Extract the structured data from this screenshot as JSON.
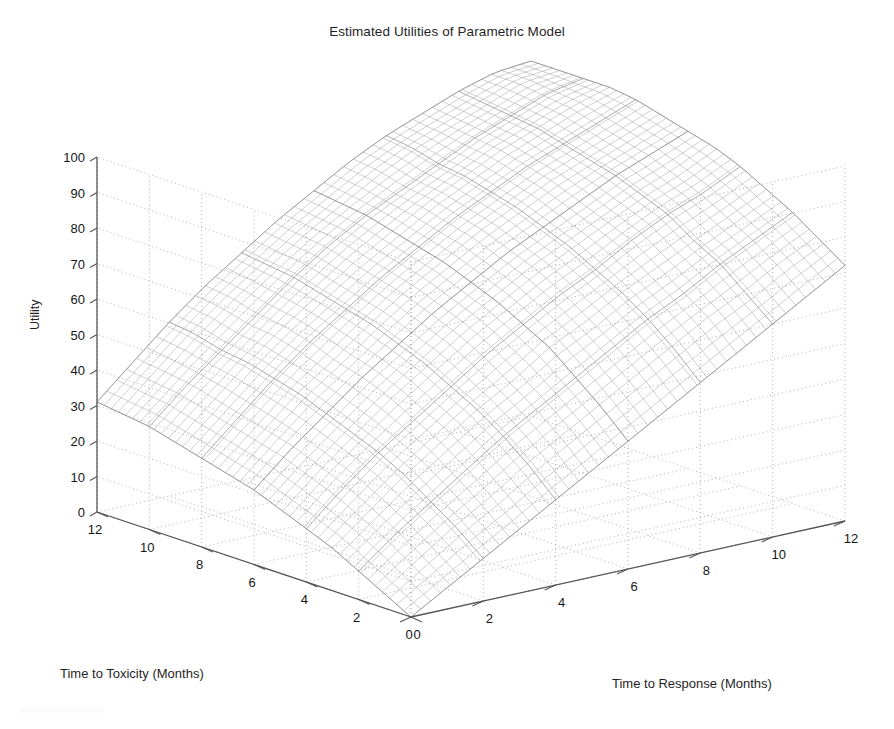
{
  "figure": {
    "title": "Estimated Utilities of Parametric Model",
    "background_color": "#ffffff",
    "axis_color": "#555555",
    "grid_color": "#aaaaaa",
    "mesh_color": "#8a8a8a",
    "width": 894,
    "height": 729
  },
  "axes": {
    "z": {
      "label": "Utility",
      "ticks": [
        "0",
        "10",
        "20",
        "30",
        "40",
        "50",
        "60",
        "70",
        "80",
        "90",
        "100"
      ],
      "min": 0,
      "max": 100
    },
    "x": {
      "label": "Time to Toxicity (Months)",
      "ticks": [
        "0",
        "2",
        "4",
        "6",
        "8",
        "10",
        "12"
      ],
      "min": 0,
      "max": 12
    },
    "y": {
      "label": "Time to Response (Months)",
      "ticks": [
        "0",
        "2",
        "4",
        "6",
        "8",
        "10",
        "12"
      ],
      "min": 0,
      "max": 12
    }
  },
  "chart_data": {
    "type": "surface",
    "title": "Estimated Utilities of Parametric Model",
    "xlabel": "Time to Toxicity (Months)",
    "ylabel": "Time to Response (Months)",
    "zlabel": "Utility",
    "xlim": [
      0,
      12
    ],
    "ylim": [
      0,
      12
    ],
    "zlim": [
      0,
      100
    ],
    "grid": true,
    "legend": "none",
    "x": [
      0,
      1,
      2,
      3,
      4,
      5,
      6,
      7,
      8,
      9,
      10,
      11,
      12
    ],
    "y": [
      0,
      1,
      2,
      3,
      4,
      5,
      6,
      7,
      8,
      9,
      10,
      11,
      12
    ],
    "z_note": "z[yi][xi] = utility at y = Time to Response, x = Time to Toxicity",
    "z": [
      [
        0,
        4,
        8,
        12,
        15,
        18,
        21,
        23,
        25,
        27,
        29,
        30,
        31
      ],
      [
        6,
        11,
        16,
        20,
        24,
        27,
        30,
        32,
        34,
        36,
        38,
        39,
        40
      ],
      [
        12,
        18,
        23,
        28,
        32,
        35,
        38,
        41,
        43,
        45,
        46,
        48,
        49
      ],
      [
        18,
        24,
        30,
        35,
        39,
        43,
        46,
        48,
        51,
        53,
        54,
        56,
        57
      ],
      [
        24,
        31,
        37,
        42,
        46,
        50,
        53,
        56,
        58,
        60,
        62,
        63,
        64
      ],
      [
        30,
        37,
        43,
        48,
        53,
        57,
        60,
        63,
        65,
        67,
        69,
        70,
        71
      ],
      [
        36,
        43,
        49,
        55,
        59,
        63,
        66,
        69,
        71,
        73,
        75,
        76,
        77
      ],
      [
        42,
        49,
        55,
        60,
        65,
        69,
        72,
        75,
        77,
        79,
        80,
        82,
        83
      ],
      [
        48,
        55,
        61,
        66,
        70,
        74,
        77,
        80,
        82,
        84,
        85,
        87,
        88
      ],
      [
        54,
        61,
        66,
        71,
        76,
        79,
        82,
        85,
        87,
        89,
        90,
        91,
        92
      ],
      [
        60,
        66,
        72,
        76,
        81,
        84,
        87,
        89,
        91,
        93,
        94,
        95,
        96
      ],
      [
        66,
        72,
        77,
        81,
        85,
        88,
        91,
        93,
        95,
        97,
        98,
        99,
        99
      ],
      [
        72,
        77,
        82,
        86,
        90,
        93,
        95,
        97,
        99,
        100,
        100,
        100,
        100
      ]
    ],
    "surface_style": "wireframe-mesh",
    "mesh_density": "fine"
  }
}
